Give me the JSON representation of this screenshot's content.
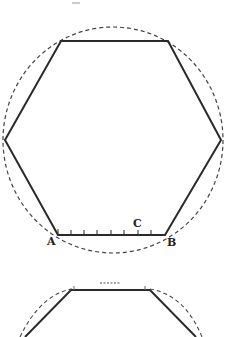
{
  "figure": {
    "labels": {
      "a": "A",
      "b": "B",
      "c": "C"
    },
    "colors": {
      "stroke": "#2a2a2a",
      "dashed": "#444444",
      "background": "#ffffff"
    }
  },
  "figure2": {
    "description": "Partial view of a second hexagon inscribed in a dashed circle"
  }
}
